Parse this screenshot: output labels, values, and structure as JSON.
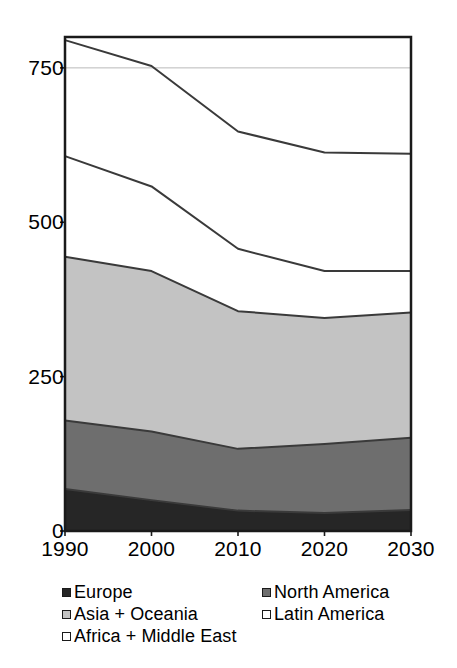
{
  "chart_data": {
    "type": "area",
    "stacked": true,
    "title": "",
    "subtitle": "",
    "xlabel": "",
    "ylabel": "",
    "categories": [
      "1990",
      "2000",
      "2010",
      "2020",
      "2030"
    ],
    "x": [
      1990,
      2000,
      2010,
      2020,
      2030
    ],
    "xlim": [
      1990,
      2030
    ],
    "ylim": [
      0,
      800
    ],
    "yticks": [
      0,
      250,
      500,
      750
    ],
    "ytick_labels": [
      "0",
      "250",
      "500",
      "750"
    ],
    "xtick_labels": [
      "1990",
      "2000",
      "2010",
      "2020",
      "2030"
    ],
    "grid": "single horizontal gridline at 750",
    "legend_position": "below-axes",
    "series": [
      {
        "name": "Europe",
        "color": "#262626",
        "values": [
          68,
          50,
          33,
          29,
          34
        ]
      },
      {
        "name": "North America",
        "color": "#6e6e6e",
        "values": [
          111,
          111,
          100,
          112,
          117
        ]
      },
      {
        "name": "Asia + Oceania",
        "color": "#c3c3c3",
        "values": [
          265,
          260,
          223,
          204,
          203
        ]
      },
      {
        "name": "Latin America",
        "color": "#ffffff",
        "values": [
          163,
          137,
          101,
          76,
          67
        ]
      },
      {
        "name": "Africa + Middle East",
        "color": "#ffffff",
        "values": [
          188,
          195,
          190,
          192,
          190
        ]
      }
    ],
    "cumulative_totals": [
      795,
      753,
      647,
      613,
      611
    ],
    "stack_boundaries": {
      "europe_top": [
        68,
        50,
        33,
        29,
        34
      ],
      "north_america_top": [
        179,
        161,
        133,
        141,
        151
      ],
      "asia_oceania_top": [
        444,
        421,
        356,
        345,
        354
      ],
      "latin_america_top": [
        607,
        558,
        457,
        421,
        421
      ],
      "africa_middle_east_top": [
        795,
        753,
        647,
        613,
        611
      ]
    }
  },
  "axis": {
    "y_ticks": [
      "750",
      "500",
      "250",
      "0"
    ],
    "x_ticks": [
      "1990",
      "2000",
      "2010",
      "2020",
      "2030"
    ]
  },
  "legend": {
    "rows": [
      {
        "left": {
          "label": "Europe",
          "color": "#262626"
        },
        "right": {
          "label": "North America",
          "color": "#6e6e6e"
        }
      },
      {
        "left": {
          "label": "Asia + Oceania",
          "color": "#c3c3c3"
        },
        "right": {
          "label": "Latin America",
          "color": "#ffffff"
        }
      },
      {
        "left": {
          "label": "Africa + Middle East",
          "color": "#ffffff"
        },
        "right": null
      }
    ]
  },
  "style": {
    "plot_border_color": "#1a1a1a",
    "series_line_color": "#3a3a3a",
    "gridline_color": "#b9b9b9",
    "background": "#ffffff"
  }
}
